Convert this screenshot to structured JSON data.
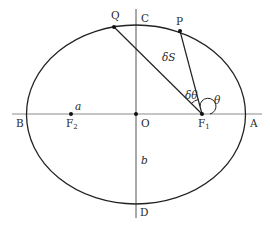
{
  "figure": {
    "type": "ellipse-orbit-diagram",
    "center": {
      "x": 136,
      "y": 114
    },
    "semi_major_px": 109.5,
    "semi_minor_px": 89.5
  },
  "points": {
    "A": {
      "label": "A",
      "x": 246,
      "y": 114
    },
    "B": {
      "label": "B",
      "x": 27,
      "y": 114
    },
    "C": {
      "label": "C",
      "x": 136,
      "y": 25
    },
    "D": {
      "label": "D",
      "x": 136,
      "y": 204
    },
    "O": {
      "label": "O",
      "x": 136,
      "y": 114
    },
    "F1": {
      "label": "F",
      "sub": "1",
      "x": 202,
      "y": 114
    },
    "F2": {
      "label": "F",
      "sub": "2",
      "x": 71,
      "y": 114
    },
    "P": {
      "label": "P",
      "x": 180,
      "y": 31
    },
    "Q": {
      "label": "Q",
      "x": 114,
      "y": 27
    }
  },
  "annotations": {
    "a": "a",
    "b": "b",
    "delta_S": "δS",
    "delta_theta": "δθ",
    "theta": "θ"
  },
  "colors": {
    "curve": "#222222",
    "axis": "#8a8a8a",
    "text": "#2a2a2a"
  }
}
